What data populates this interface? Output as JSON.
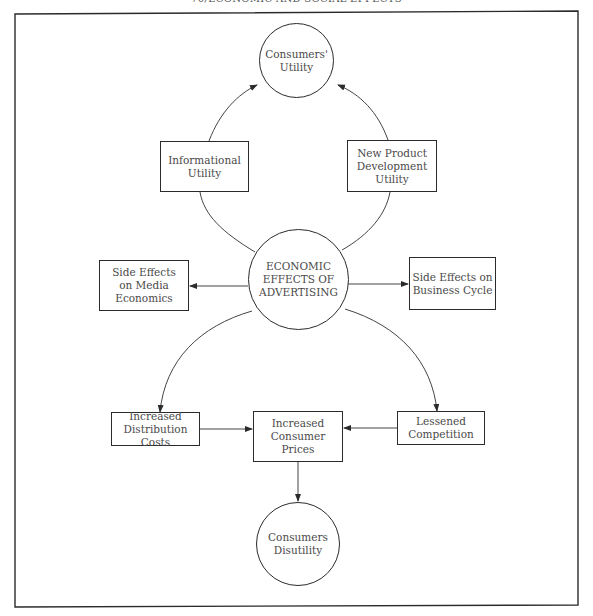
{
  "page": {
    "header": "70/ECONOMIC AND SOCIAL EFFECTS"
  },
  "diagram": {
    "title": "Economic Effects of Advertising",
    "nodes": {
      "consumers_utility": {
        "label": "Consumers'\nUtility",
        "shape": "circle"
      },
      "informational_utility": {
        "label": "Informational\nUtility",
        "shape": "box"
      },
      "new_product_utility": {
        "label": "New Product\nDevelopment\nUtility",
        "shape": "box"
      },
      "economic_effects": {
        "label": "ECONOMIC\nEFFECTS OF\nADVERTISING",
        "shape": "circle"
      },
      "side_effects_media": {
        "label": "Side Effects\non Media\nEconomics",
        "shape": "box"
      },
      "side_effects_business": {
        "label": "Side Effects on\nBusiness Cycle",
        "shape": "box"
      },
      "increased_distribution": {
        "label": "Increased\nDistribution Costs",
        "shape": "box"
      },
      "increased_prices": {
        "label": "Increased\nConsumer\nPrices",
        "shape": "box"
      },
      "lessened_competition": {
        "label": "Lessened\nCompetition",
        "shape": "box"
      },
      "consumers_disutility": {
        "label": "Consumers\nDisutility",
        "shape": "circle"
      }
    },
    "edges": [
      {
        "from": "economic_effects",
        "to": "consumers_utility",
        "via": "informational_utility",
        "type": "curved-arrow"
      },
      {
        "from": "economic_effects",
        "to": "consumers_utility",
        "via": "new_product_utility",
        "type": "curved-arrow"
      },
      {
        "from": "economic_effects",
        "to": "side_effects_media",
        "type": "arrow"
      },
      {
        "from": "economic_effects",
        "to": "side_effects_business",
        "type": "arrow"
      },
      {
        "from": "economic_effects",
        "to": "increased_distribution",
        "type": "curved-arrow"
      },
      {
        "from": "economic_effects",
        "to": "lessened_competition",
        "type": "curved-arrow"
      },
      {
        "from": "increased_distribution",
        "to": "increased_prices",
        "type": "arrow"
      },
      {
        "from": "lessened_competition",
        "to": "increased_prices",
        "type": "arrow"
      },
      {
        "from": "increased_prices",
        "to": "consumers_disutility",
        "type": "arrow"
      }
    ],
    "colors": {
      "stroke": "#2b2b2b",
      "text": "#4a4a4a",
      "background": "#ffffff"
    }
  }
}
